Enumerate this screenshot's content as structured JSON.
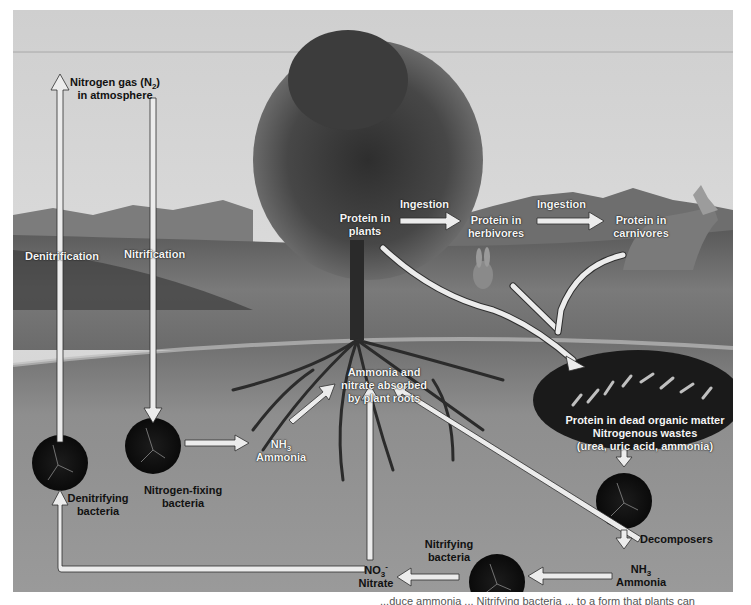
{
  "diagram": {
    "colors": {
      "sky": "#d8d8d8",
      "soil": "#8c8c8c",
      "arrow_fill": "#eeeeee",
      "arrow_stroke": "#333333",
      "bacteria": "#141414"
    },
    "nodes": {
      "atmosphere_line1": "Nitrogen gas (N",
      "atmosphere_sub": "2",
      "atmosphere_line1_end": ")",
      "atmosphere_line2": "in atmosphere",
      "protein_plants_1": "Protein in",
      "protein_plants_2": "plants",
      "protein_herbivores_1": "Protein in",
      "protein_herbivores_2": "herbivores",
      "protein_carnivores_1": "Protein in",
      "protein_carnivores_2": "carnivores",
      "absorbed_1": "Ammonia and",
      "absorbed_2": "nitrate absorbed",
      "absorbed_3": "by plant roots",
      "dead_matter_1": "Protein in dead organic matter",
      "dead_matter_2": "Nitrogenous wastes",
      "dead_matter_3": "(urea, uric acid, ammonia)",
      "nh3_left_formula": "NH",
      "nh3_left_sub": "3",
      "nh3_left_name": "Ammonia",
      "nh3_right_formula": "NH",
      "nh3_right_sub": "3",
      "nh3_right_name": "Ammonia",
      "nitrate_formula": "NO",
      "nitrate_sub": "3",
      "nitrate_sup": "-",
      "nitrate_name": "Nitrate",
      "denitrifying_1": "Denitrifying",
      "denitrifying_2": "bacteria",
      "nitrogen_fixing_1": "Nitrogen-fixing",
      "nitrogen_fixing_2": "bacteria",
      "nitrifying_1": "Nitrifying",
      "nitrifying_2": "bacteria",
      "decomposers": "Decomposers"
    },
    "processes": {
      "denitrification": "Denitrification",
      "nitrification": "Nitrification",
      "ingestion_1": "Ingestion",
      "ingestion_2": "Ingestion"
    },
    "caption_fragment": "...duce ammonia ... Nitrifying bacteria ... to a form that plants can"
  }
}
